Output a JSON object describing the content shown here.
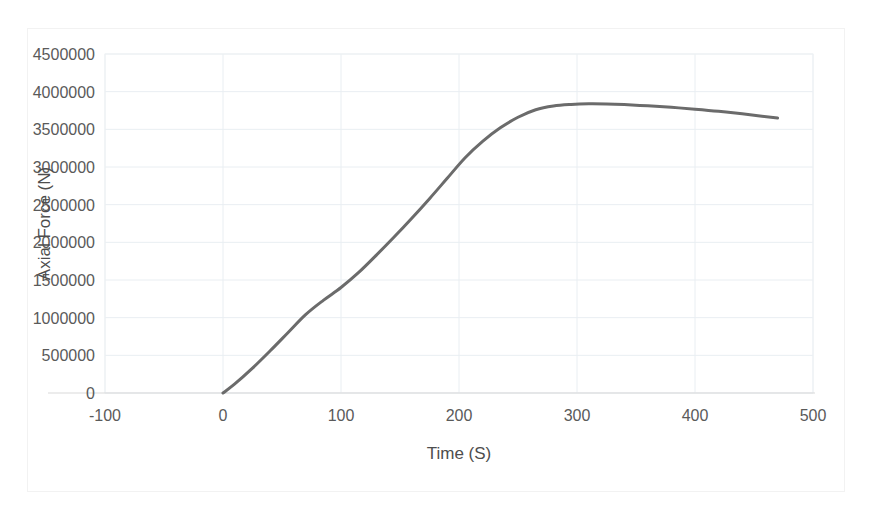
{
  "chart_data": {
    "type": "line",
    "title": "",
    "xlabel": "Time (S)",
    "ylabel": "Axial Force (N)",
    "xlim": [
      -100,
      500
    ],
    "ylim": [
      0,
      4500000
    ],
    "xticks": [
      "-100",
      "0",
      "100",
      "200",
      "300",
      "400",
      "500"
    ],
    "yticks": [
      "0",
      "500000",
      "1000000",
      "1500000",
      "2000000",
      "2500000",
      "3000000",
      "3500000",
      "4000000",
      "4500000"
    ],
    "xtick_values": [
      -100,
      0,
      100,
      200,
      300,
      400,
      500
    ],
    "ytick_values": [
      0,
      500000,
      1000000,
      1500000,
      2000000,
      2500000,
      3000000,
      3500000,
      4000000,
      4500000
    ],
    "grid": true,
    "legend": false,
    "series": [
      {
        "name": "Axial Force",
        "color": "#6b6b6b",
        "x": [
          0,
          10,
          25,
          40,
          55,
          70,
          85,
          100,
          115,
          130,
          145,
          160,
          175,
          190,
          205,
          220,
          235,
          250,
          265,
          280,
          295,
          310,
          325,
          340,
          360,
          380,
          400,
          420,
          440,
          470
        ],
        "values": [
          0,
          120000,
          330000,
          560000,
          800000,
          1040000,
          1230000,
          1400000,
          1600000,
          1830000,
          2070000,
          2320000,
          2580000,
          2850000,
          3120000,
          3340000,
          3520000,
          3660000,
          3760000,
          3810000,
          3830000,
          3838000,
          3836000,
          3828000,
          3812000,
          3792000,
          3768000,
          3740000,
          3706000,
          3650000
        ]
      }
    ]
  },
  "axis": {
    "y_title": "Axial Force (N)",
    "x_title": "Time (S)"
  }
}
